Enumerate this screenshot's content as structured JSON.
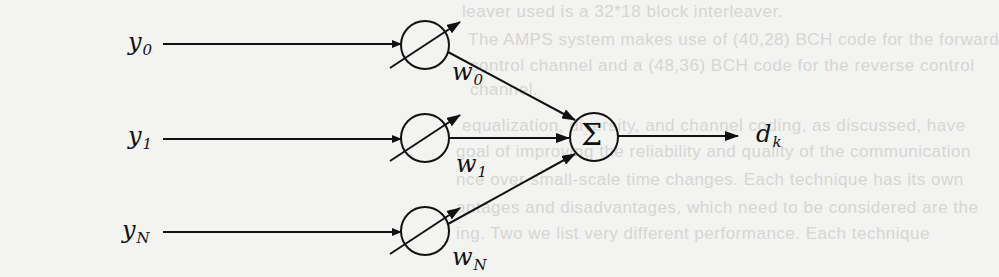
{
  "diagram": {
    "type": "adaptive-linear-combiner",
    "inputs": [
      {
        "label": "y",
        "sub": "0",
        "weight": "w",
        "weight_sub": "0"
      },
      {
        "label": "y",
        "sub": "1",
        "weight": "w",
        "weight_sub": "1"
      },
      {
        "label": "y",
        "sub": "N",
        "weight": "w",
        "weight_sub": "N"
      }
    ],
    "summer": {
      "symbol": "Σ"
    },
    "output": {
      "label": "d",
      "sub": "k"
    },
    "colors": {
      "ink": "#111111",
      "paper": "#f3f3f1",
      "bleed": "#d6d6d3"
    }
  },
  "bleed_through_text": [
    "leaver used is a 32*18 block interleaver.",
    "The AMPS system makes use of (40,28) BCH code for the forward",
    "control channel and a (48,36) BCH code for the reverse control",
    "channel.",
    "equalization, diversity, and channel coding, as discussed, have",
    "goal of improving the reliability and quality of the communication",
    "nce over small-scale time changes. Each technique has its own",
    "antages and disadvantages, which need to be considered are the",
    "ing. Two we list very different performance. Each technique"
  ]
}
